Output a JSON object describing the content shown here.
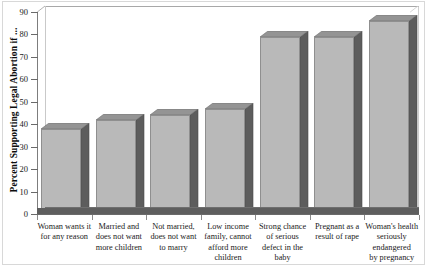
{
  "chart_data": {
    "type": "bar",
    "title": "",
    "xlabel": "",
    "ylabel": "Percent Supporting Legal Abortion if ...",
    "ylim": [
      0,
      90
    ],
    "yticks": [
      0,
      10,
      20,
      30,
      40,
      50,
      60,
      70,
      80,
      90
    ],
    "grid": false,
    "legend": "none",
    "style": "3d-column",
    "categories": [
      "Woman wants it for any reason",
      "Married and does not want more children",
      "Not married, does not want to marry",
      "Low income family, cannot afford more children",
      "Strong chance of serious defect in the baby",
      "Pregnant as a result of rape",
      "Woman's health seriously endangered by pregnancy"
    ],
    "category_lines": [
      [
        "Woman wants it",
        "for any reason"
      ],
      [
        "Married and",
        "does not want",
        "more children"
      ],
      [
        "Not married,",
        "does not want",
        "to marry"
      ],
      [
        "Low income",
        "family, cannot",
        "afford more",
        "children"
      ],
      [
        "Strong chance",
        "of serious",
        "defect in the",
        "baby"
      ],
      [
        "Pregnant as a",
        "result of rape"
      ],
      [
        "Woman's health",
        "seriously endangered",
        "by pregnancy"
      ]
    ],
    "values": [
      38,
      42,
      44,
      47,
      79,
      79,
      86
    ],
    "colors": {
      "bar_front": "#b9b9b9",
      "bar_side": "#5d5d5d",
      "bar_top": "#949494",
      "floor": "#5e5e5e",
      "axis": "#6a6a6a",
      "background": "#ffffff",
      "text": "#1a1a1a"
    }
  }
}
